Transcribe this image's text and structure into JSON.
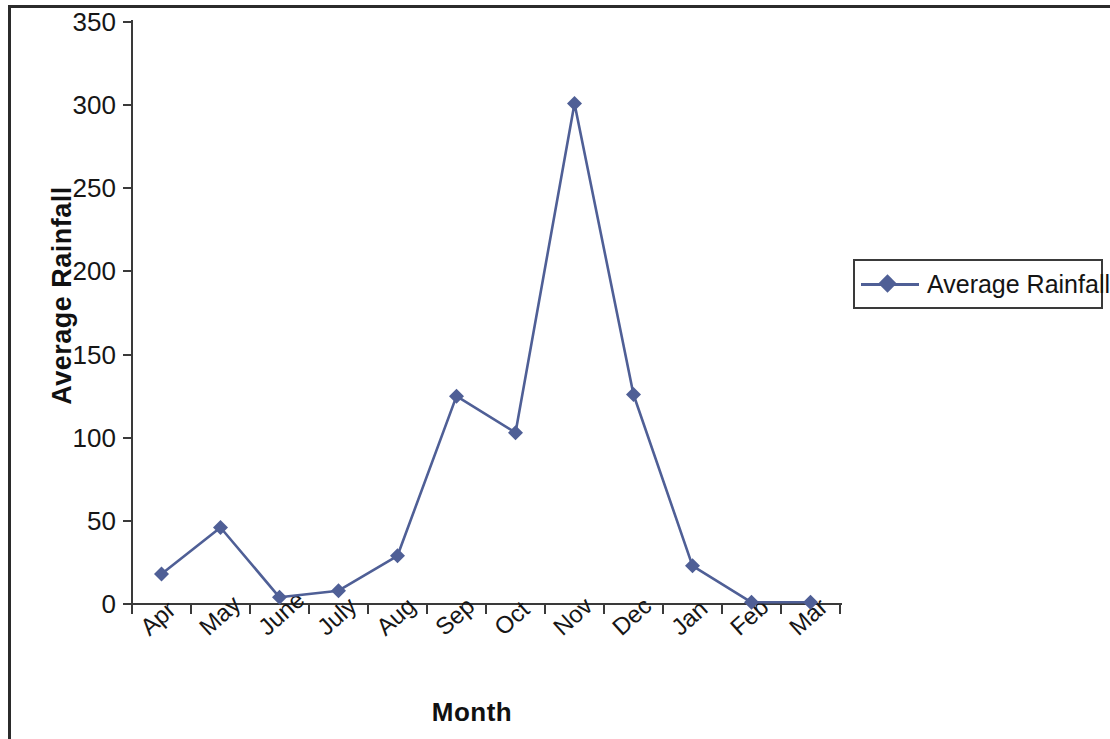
{
  "chart_data": {
    "type": "line",
    "title": "",
    "xlabel": "Month",
    "ylabel": "Average Rainfall",
    "categories": [
      "Apr",
      "May",
      "June",
      "July",
      "Aug",
      "Sep",
      "Oct",
      "Nov",
      "Dec",
      "Jan",
      "Feb",
      "Mar"
    ],
    "series": [
      {
        "name": "Average Rainfall",
        "values": [
          18,
          46,
          4,
          8,
          29,
          125,
          103,
          301,
          126,
          23,
          1,
          1
        ],
        "color": "#4f5f96",
        "marker": "diamond"
      }
    ],
    "ylim": [
      0,
      350
    ],
    "ytick_values": [
      0,
      50,
      100,
      150,
      200,
      250,
      300,
      350
    ],
    "ytick_labels": [
      "0",
      "50",
      "100",
      "150",
      "200",
      "250",
      "300",
      "350"
    ],
    "grid": false,
    "legend_position": "right",
    "xtick_rotation": -42
  },
  "legend": {
    "entries": [
      {
        "label": "Average Rainfall",
        "marker_icon": "diamond-marker-icon"
      }
    ]
  },
  "axes": {
    "y_title": "Average Rainfall",
    "x_title": "Month"
  },
  "colors": {
    "series": "#4f5f96",
    "axis": "#3a3a3a",
    "text": "#161616",
    "frame": "#2b2b2b",
    "background": "#ffffff"
  }
}
